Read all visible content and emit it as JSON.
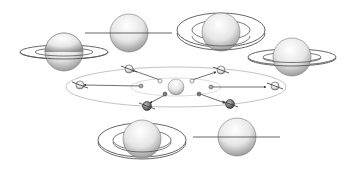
{
  "diagram": {
    "title": "",
    "colors": {
      "background": "#ffffff",
      "outline": "#555555",
      "orbit": "#bbbbbb",
      "globe_light": "#ffffff",
      "globe_dark": "#9a9a9a",
      "dark_planet": "#555555"
    },
    "views": [
      {
        "id": "top-left",
        "ring_state": "slightly-open"
      },
      {
        "id": "top-center",
        "ring_state": "edge-on"
      },
      {
        "id": "top-right",
        "ring_state": "fully-open"
      },
      {
        "id": "right",
        "ring_state": "slightly-open"
      },
      {
        "id": "bottom-left",
        "ring_state": "fully-open"
      },
      {
        "id": "bottom-right",
        "ring_state": "edge-on"
      }
    ],
    "central_orbit": {
      "sun": "sun-icon",
      "orbit_positions": 8
    },
    "labels": []
  }
}
